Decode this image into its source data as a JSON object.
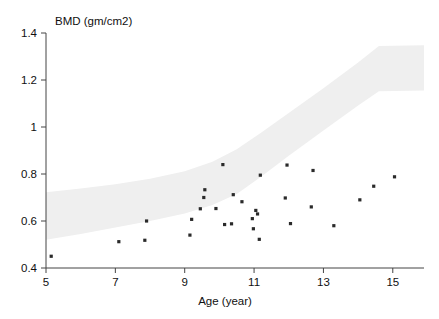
{
  "chart_data": {
    "type": "scatter",
    "title": "",
    "xlabel": "Age (year)",
    "ylabel": "BMD (gm/cm2)",
    "ylabel_position": "top-left-horizontal",
    "xlim": [
      5,
      15.9
    ],
    "ylim": [
      0.4,
      1.4
    ],
    "xticks": [
      5,
      7,
      9,
      11,
      13,
      15
    ],
    "xtick_labels": [
      "5",
      "7",
      "9",
      "11",
      "13",
      "15"
    ],
    "yticks": [
      0.4,
      0.6,
      0.8,
      1.0,
      1.2,
      1.4
    ],
    "ytick_labels": [
      "0.4",
      "0.6",
      "0.8",
      "1",
      "1.2",
      "1.4"
    ],
    "grid": false,
    "legend": "none",
    "series": [
      {
        "name": "patients",
        "marker": "small-filled-square",
        "color": "#2a2a2a",
        "points": [
          [
            5.15,
            0.45
          ],
          [
            7.1,
            0.512
          ],
          [
            7.85,
            0.518
          ],
          [
            7.9,
            0.6
          ],
          [
            9.15,
            0.54
          ],
          [
            9.2,
            0.607
          ],
          [
            9.45,
            0.652
          ],
          [
            9.55,
            0.7
          ],
          [
            9.58,
            0.733
          ],
          [
            9.9,
            0.653
          ],
          [
            10.1,
            0.84
          ],
          [
            10.15,
            0.585
          ],
          [
            10.35,
            0.588
          ],
          [
            10.4,
            0.712
          ],
          [
            10.65,
            0.682
          ],
          [
            10.95,
            0.61
          ],
          [
            10.98,
            0.567
          ],
          [
            11.05,
            0.645
          ],
          [
            11.1,
            0.63
          ],
          [
            11.15,
            0.522
          ],
          [
            11.18,
            0.795
          ],
          [
            11.9,
            0.698
          ],
          [
            11.95,
            0.838
          ],
          [
            12.05,
            0.589
          ],
          [
            12.65,
            0.66
          ],
          [
            12.7,
            0.815
          ],
          [
            13.3,
            0.58
          ],
          [
            14.05,
            0.69
          ],
          [
            14.45,
            0.748
          ],
          [
            15.05,
            0.788
          ]
        ]
      }
    ],
    "reference_band": {
      "name": "normal reference range (shaded)",
      "color": "#efefef",
      "upper": [
        [
          5.0,
          0.722
        ],
        [
          6.0,
          0.738
        ],
        [
          7.0,
          0.756
        ],
        [
          8.0,
          0.78
        ],
        [
          9.0,
          0.812
        ],
        [
          9.8,
          0.852
        ],
        [
          10.5,
          0.905
        ],
        [
          11.2,
          0.975
        ],
        [
          12.0,
          1.06
        ],
        [
          13.0,
          1.165
        ],
        [
          14.0,
          1.275
        ],
        [
          14.6,
          1.345
        ],
        [
          15.9,
          1.348
        ]
      ],
      "lower": [
        [
          5.0,
          0.52
        ],
        [
          6.0,
          0.545
        ],
        [
          7.0,
          0.572
        ],
        [
          8.0,
          0.6
        ],
        [
          9.0,
          0.632
        ],
        [
          9.8,
          0.668
        ],
        [
          10.5,
          0.715
        ],
        [
          11.2,
          0.788
        ],
        [
          12.0,
          0.878
        ],
        [
          13.0,
          0.985
        ],
        [
          14.0,
          1.092
        ],
        [
          14.6,
          1.152
        ],
        [
          15.9,
          1.155
        ]
      ]
    }
  }
}
